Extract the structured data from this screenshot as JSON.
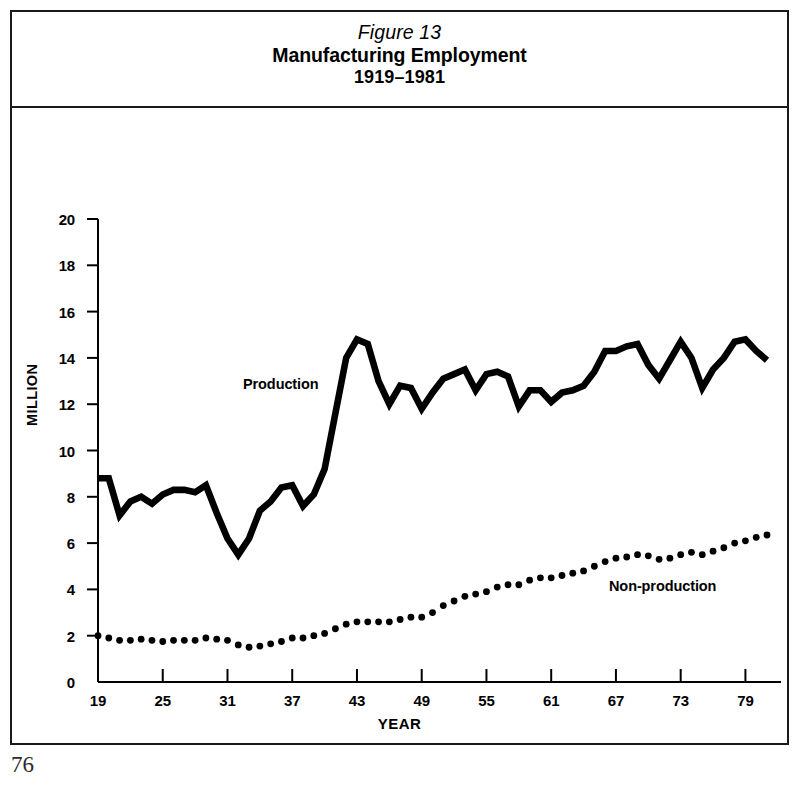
{
  "page": {
    "page_number": "76"
  },
  "figure": {
    "number_label": "Figure 13",
    "title": "Manufacturing Employment",
    "subtitle": "1919–1981"
  },
  "colors": {
    "ink": "#000000",
    "frame": "#1a1a1a",
    "background": "#ffffff"
  },
  "chart_data": {
    "type": "line",
    "title": "Manufacturing Employment 1919–1981",
    "subtitle": "Figure 13",
    "xlabel": "YEAR",
    "ylabel": "MILLION",
    "xlim": [
      19,
      81
    ],
    "ylim": [
      0,
      20
    ],
    "ytick_step": 2,
    "grid": false,
    "legend_position": "inline-annotations",
    "y_ticks": [
      "0",
      "2",
      "4",
      "6",
      "8",
      "10",
      "12",
      "14",
      "16",
      "18",
      "20"
    ],
    "x_ticks": [
      "19",
      "25",
      "31",
      "37",
      "43",
      "49",
      "55",
      "61",
      "67",
      "73",
      "79"
    ],
    "x_tick_values": [
      19,
      25,
      31,
      37,
      43,
      49,
      55,
      61,
      67,
      73,
      79
    ],
    "annotations": [
      {
        "text": "Production",
        "x": 31,
        "y": 12.8
      },
      {
        "text": "Non-production",
        "x": 64,
        "y": 4.3
      }
    ],
    "x": [
      19,
      20,
      21,
      22,
      23,
      24,
      25,
      26,
      27,
      28,
      29,
      30,
      31,
      32,
      33,
      34,
      35,
      36,
      37,
      38,
      39,
      40,
      41,
      42,
      43,
      44,
      45,
      46,
      47,
      48,
      49,
      50,
      51,
      52,
      53,
      54,
      55,
      56,
      57,
      58,
      59,
      60,
      61,
      62,
      63,
      64,
      65,
      66,
      67,
      68,
      69,
      70,
      71,
      72,
      73,
      74,
      75,
      76,
      77,
      78,
      79,
      80,
      81
    ],
    "series": [
      {
        "name": "Production",
        "style": "solid-thick",
        "values": [
          8.8,
          8.8,
          7.2,
          7.8,
          8.0,
          7.7,
          8.1,
          8.3,
          8.3,
          8.2,
          8.5,
          7.3,
          6.2,
          5.5,
          6.2,
          7.4,
          7.8,
          8.4,
          8.5,
          7.6,
          8.1,
          9.2,
          11.6,
          14.0,
          14.8,
          14.6,
          13.0,
          12.0,
          12.8,
          12.7,
          11.8,
          12.5,
          13.1,
          13.3,
          13.5,
          12.6,
          13.3,
          13.4,
          13.2,
          11.9,
          12.6,
          12.6,
          12.1,
          12.5,
          12.6,
          12.8,
          13.4,
          14.3,
          14.3,
          14.5,
          14.6,
          13.7,
          13.1,
          13.9,
          14.7,
          14.0,
          12.7,
          13.5,
          14.0,
          14.7,
          14.8,
          14.3,
          13.9
        ]
      },
      {
        "name": "Non-production",
        "style": "dotted",
        "values": [
          2.0,
          1.9,
          1.8,
          1.8,
          1.85,
          1.8,
          1.75,
          1.8,
          1.8,
          1.8,
          1.9,
          1.85,
          1.8,
          1.6,
          1.5,
          1.55,
          1.65,
          1.75,
          1.9,
          1.9,
          2.0,
          2.1,
          2.3,
          2.5,
          2.6,
          2.6,
          2.6,
          2.6,
          2.7,
          2.8,
          2.8,
          3.0,
          3.3,
          3.5,
          3.7,
          3.8,
          3.9,
          4.1,
          4.2,
          4.2,
          4.4,
          4.5,
          4.5,
          4.6,
          4.7,
          4.8,
          5.0,
          5.2,
          5.35,
          5.4,
          5.5,
          5.45,
          5.3,
          5.35,
          5.5,
          5.6,
          5.5,
          5.65,
          5.8,
          6.0,
          6.1,
          6.25,
          6.35
        ]
      }
    ]
  }
}
